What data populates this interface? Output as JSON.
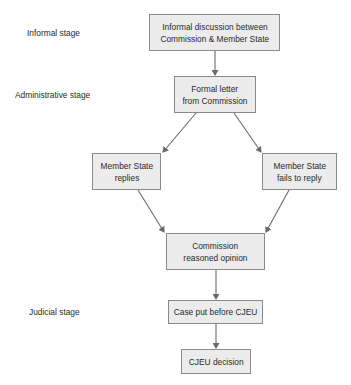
{
  "stages": [
    {
      "id": "informal",
      "label": "Informal stage"
    },
    {
      "id": "administrative",
      "label": "Administrative stage"
    },
    {
      "id": "judicial",
      "label": "Judicial stage"
    }
  ],
  "nodes": {
    "informal_discussion": {
      "lines": [
        "Informal discussion between",
        "Commission & Member State"
      ]
    },
    "formal_letter": {
      "lines": [
        "Formal letter",
        "from Commission"
      ]
    },
    "ms_replies": {
      "lines": [
        "Member State",
        "replies"
      ]
    },
    "ms_fails": {
      "lines": [
        "Member State",
        "fails to reply"
      ]
    },
    "reasoned_opinion": {
      "lines": [
        "Commission",
        "reasoned opinion"
      ]
    },
    "case_before_cjeu": {
      "lines": [
        "Case put before CJEU"
      ]
    },
    "cjeu_decision": {
      "lines": [
        "CJEU decision"
      ]
    }
  },
  "edges": [
    [
      "informal_discussion",
      "formal_letter"
    ],
    [
      "formal_letter",
      "ms_replies"
    ],
    [
      "formal_letter",
      "ms_fails"
    ],
    [
      "ms_replies",
      "reasoned_opinion"
    ],
    [
      "ms_fails",
      "reasoned_opinion"
    ],
    [
      "reasoned_opinion",
      "case_before_cjeu"
    ],
    [
      "case_before_cjeu",
      "cjeu_decision"
    ]
  ],
  "colors": {
    "box_fill": "#ececec",
    "box_border": "#8a8a8a",
    "arrow": "#6a6a6a"
  }
}
